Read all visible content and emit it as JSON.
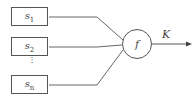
{
  "diagram": {
    "inputs": [
      {
        "base": "s",
        "sub": "1"
      },
      {
        "base": "s",
        "sub": "2"
      },
      {
        "base": "s",
        "sub": "n"
      }
    ],
    "ellipsis": "⋮",
    "function_label": "f",
    "output_label": "K",
    "colors": {
      "stroke": "#555555",
      "text": "#444444"
    }
  }
}
